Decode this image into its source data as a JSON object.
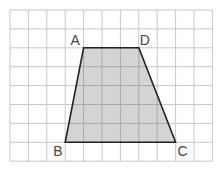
{
  "diagram": {
    "type": "trapezoid-on-grid",
    "grid": {
      "columns": 11,
      "rows": 8,
      "origin_x": 10,
      "origin_y": 10,
      "cell_w": 18.4,
      "cell_h": 18.9,
      "line_color": "#c8c8c8"
    },
    "shape": {
      "fill": "#d4d4d4",
      "stroke": "#222222",
      "vertices": [
        {
          "label": "A",
          "col": 4,
          "row": 2
        },
        {
          "label": "D",
          "col": 7,
          "row": 2
        },
        {
          "label": "C",
          "col": 9,
          "row": 7
        },
        {
          "label": "B",
          "col": 3,
          "row": 7
        }
      ]
    },
    "labels": {
      "A": "A",
      "B": "B",
      "C": "C",
      "D": "D"
    }
  }
}
